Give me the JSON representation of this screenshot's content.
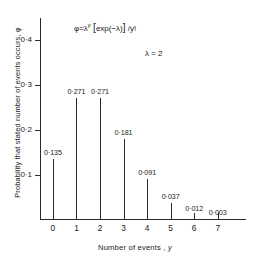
{
  "chart_data": {
    "type": "bar",
    "subtype": "stem",
    "title": "",
    "xlabel": "Number of events , y",
    "ylabel": "Probability that stated number of events occurs, φ",
    "categories": [
      "0",
      "1",
      "2",
      "3",
      "4",
      "5",
      "6",
      "7"
    ],
    "x": [
      0,
      1,
      2,
      3,
      4,
      5,
      6,
      7
    ],
    "values": [
      0.135,
      0.271,
      0.271,
      0.181,
      0.091,
      0.037,
      0.012,
      0.003
    ],
    "data_labels": [
      "0·135",
      "0·271",
      "0·271",
      "0·181",
      "0·091",
      "0·037",
      "0·012",
      "0·003"
    ],
    "xlim": [
      -0.55,
      8.2
    ],
    "ylim": [
      0,
      0.45
    ],
    "ytick_values": [
      0.1,
      0.2,
      0.3,
      0.4
    ],
    "ytick_labels": [
      "0·1",
      "0·2",
      "0·3",
      "0·4"
    ],
    "xtick_labels": [
      "0",
      "1",
      "2",
      "3",
      "4",
      "5",
      "6",
      "7"
    ],
    "grid": false,
    "legend": null,
    "annotations": [
      {
        "name": "formula",
        "text": "φ = λ^y [exp(−λ)] / y!",
        "parts": {
          "phi_eq": "φ=λ",
          "exponent": "y",
          "bracket_open": "[",
          "exp_body": "exp(−λ)",
          "bracket_close": "]",
          "divisor": "/y!"
        }
      },
      {
        "name": "lambda-value",
        "text": "λ = 2"
      }
    ],
    "line_color": "#2b2b2b",
    "background_color": "#ffffff"
  }
}
